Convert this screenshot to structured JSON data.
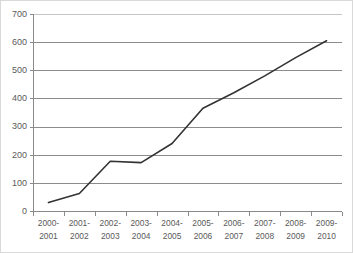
{
  "chart_data": {
    "type": "line",
    "title": "",
    "subtitle": "",
    "xlabel": "",
    "ylabel": "",
    "categories": [
      "2000-\n2001",
      "2001-\n2002",
      "2002-\n2003",
      "2003-\n2004",
      "2004-\n2005",
      "2005-\n2006",
      "2006-\n2007",
      "2007-\n2008",
      "2008-\n2009",
      "2009-\n2010"
    ],
    "category_lines": [
      [
        "2000-",
        "2001"
      ],
      [
        "2001-",
        "2002"
      ],
      [
        "2002-",
        "2003"
      ],
      [
        "2003-",
        "2004"
      ],
      [
        "2004-",
        "2005"
      ],
      [
        "2005-",
        "2006"
      ],
      [
        "2006-",
        "2007"
      ],
      [
        "2007-",
        "2008"
      ],
      [
        "2008-",
        "2009"
      ],
      [
        "2009-",
        "2010"
      ]
    ],
    "values": [
      30,
      62,
      177,
      172,
      240,
      365,
      420,
      480,
      545,
      605
    ],
    "series": [
      {
        "name": "",
        "color": "#333333",
        "values": [
          30,
          62,
          177,
          172,
          240,
          365,
          420,
          480,
          545,
          605
        ]
      }
    ],
    "ylim": [
      0,
      700
    ],
    "ytick_values": [
      0,
      100,
      200,
      300,
      400,
      500,
      600,
      700
    ],
    "ytick_labels": [
      "0",
      "100",
      "200",
      "300",
      "400",
      "500",
      "600",
      "700"
    ],
    "grid": true,
    "grid_axis": "y",
    "legend": false,
    "legend_position": "none",
    "markers": false,
    "line_color": "#333333",
    "gridline_color": "#808080",
    "axis_color": "#8a8a8a",
    "tick_label_color": "#5a5a5a",
    "background_color": "#ffffff",
    "annotations": []
  }
}
